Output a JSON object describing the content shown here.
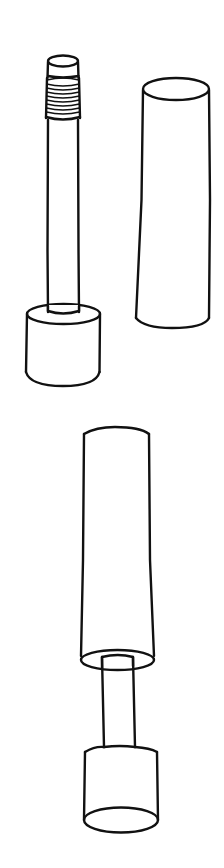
{
  "figure": {
    "description": "Line drawing of a rod with threaded tip and base, a separate tube sleeve, and the assembled unit with sleeve fitted over the rod",
    "stroke_color": "#111111",
    "background_color": "#ffffff",
    "parts": [
      {
        "id": "threaded-rod",
        "label": "Threaded rod with base"
      },
      {
        "id": "sleeve-tube",
        "label": "Sleeve tube"
      },
      {
        "id": "assembly",
        "label": "Assembled unit"
      }
    ]
  }
}
